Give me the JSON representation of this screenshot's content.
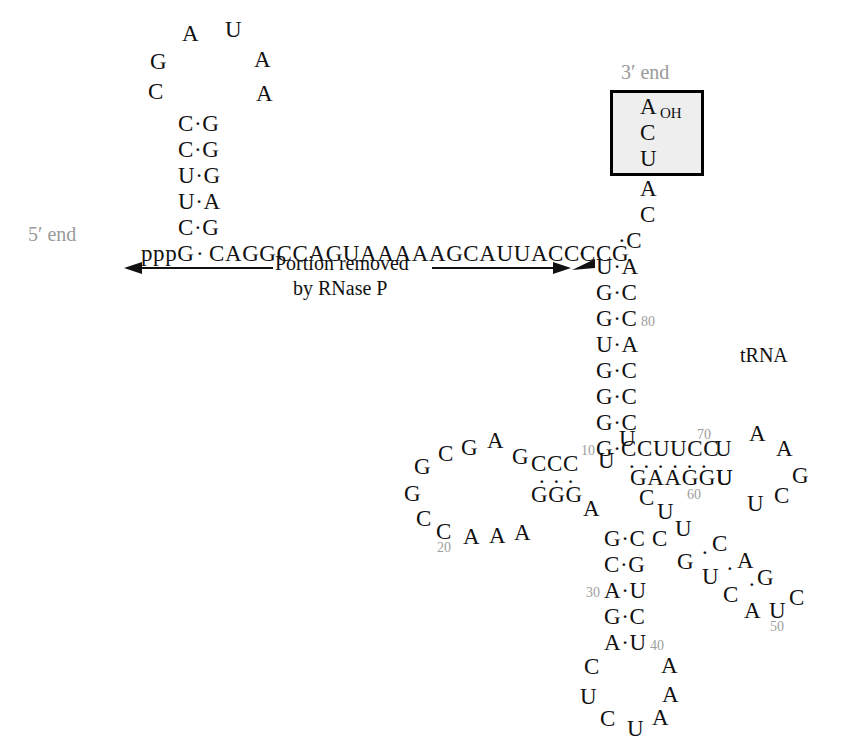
{
  "figure": {
    "type": "rna-secondary-structure",
    "labels": {
      "five_prime": "5′ end",
      "three_prime": "3′ end",
      "trna": "tRNA",
      "cleavage_note_line1": "Portion removed",
      "cleavage_note_line2": "by RNase P",
      "terminal_oh": "OH"
    },
    "colors": {
      "label_gray": "#9a9a9a",
      "number_gray": "#9e9e9e",
      "base_black": "#111111",
      "box_fill": "#eeeeee",
      "box_border": "#000000"
    }
  },
  "leader": {
    "five_prime_triphosphate": "pppG",
    "sequence_line": "CAGGCCAGUAAAAAGCAUUACCCCG",
    "hairpin_left_up": [
      "C",
      "G",
      "A"
    ],
    "hairpin_right_down": [
      "U",
      "A",
      "A"
    ],
    "hairpin_stem_left": [
      "C",
      "C",
      "U",
      "U",
      "C"
    ],
    "hairpin_stem_right": [
      "G",
      "G",
      "G",
      "A",
      "G"
    ]
  },
  "acceptor_stem": {
    "left_strand": [
      "U",
      "G",
      "G",
      "U",
      "G",
      "G",
      "G",
      "G"
    ],
    "right_strand": [
      "A",
      "C",
      "C",
      "A",
      "C",
      "C",
      "C",
      "C"
    ],
    "single_stranded_3p": [
      "C",
      "A"
    ],
    "cca_box": [
      "A",
      "C",
      "U"
    ],
    "number_80": "80",
    "cleavage_marker": "arrowhead"
  },
  "d_arm": {
    "stem_top": "CCC",
    "stem_bottom": "GGG",
    "loop_upper": [
      "G",
      "C",
      "G",
      "A",
      "G"
    ],
    "loop_lower": [
      "G",
      "C",
      "C",
      "A",
      "A",
      "A"
    ],
    "number_20": "20",
    "number_10": "10",
    "linker_u_upper": "U",
    "linker_u_lower": "U"
  },
  "anticodon_arm": {
    "pairs": [
      {
        "left": "G",
        "right": "C"
      },
      {
        "left": "C",
        "right": "G"
      },
      {
        "left": "A",
        "right": "U"
      },
      {
        "left": "G",
        "right": "C"
      },
      {
        "left": "A",
        "right": "U"
      }
    ],
    "number_30": "30",
    "number_40": "40",
    "linker_a": "A",
    "extra_c": "C",
    "loop": [
      "C",
      "U",
      "C",
      "U",
      "A",
      "A",
      "A"
    ]
  },
  "variable_loop": {
    "top_run": [
      "C",
      "C"
    ],
    "upper_chain": [
      "C",
      "U",
      "U",
      "C",
      "A",
      "G",
      "C"
    ],
    "lower_chain": [
      "G",
      "U",
      "C",
      "A",
      "U"
    ],
    "number_50": "50"
  },
  "t_arm": {
    "top_strand": "CCUUCC",
    "bottom_strand": "GAAGGU",
    "number_70": "70",
    "number_60": "60",
    "loop": [
      "U",
      "A",
      "A",
      "G",
      "C",
      "U",
      "U"
    ]
  }
}
